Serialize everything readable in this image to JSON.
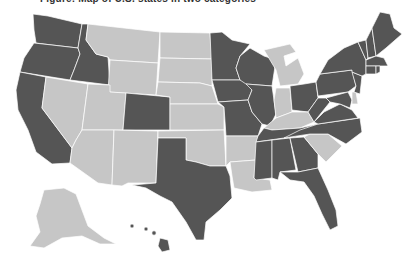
{
  "caption": {
    "text": "Figure: Map of U.S. states in two categories",
    "tail": ""
  },
  "legend_colors": {
    "dark": "#555555",
    "light": "#c6c6c6",
    "border": "#ffffff"
  },
  "states": {
    "WA": "dark",
    "OR": "dark",
    "CA": "dark",
    "ID": "dark",
    "NV": "light",
    "MT": "light",
    "WY": "light",
    "UT": "light",
    "AZ": "light",
    "CO": "dark",
    "NM": "light",
    "ND": "light",
    "SD": "light",
    "NE": "light",
    "KS": "light",
    "OK": "light",
    "TX": "dark",
    "MN": "dark",
    "IA": "dark",
    "MO": "dark",
    "AR": "light",
    "LA": "light",
    "WI": "dark",
    "IL": "dark",
    "MI": "light",
    "IN": "light",
    "OH": "dark",
    "KY": "light",
    "TN": "dark",
    "MS": "dark",
    "AL": "dark",
    "GA": "dark",
    "FL": "dark",
    "SC": "light",
    "NC": "dark",
    "VA": "dark",
    "WV": "dark",
    "PA": "dark",
    "NY": "dark",
    "NJ": "dark",
    "DE": "light",
    "MD": "dark",
    "CT": "dark",
    "RI": "dark",
    "MA": "dark",
    "VT": "dark",
    "NH": "dark",
    "ME": "dark",
    "AK": "light",
    "HI": "dark"
  }
}
